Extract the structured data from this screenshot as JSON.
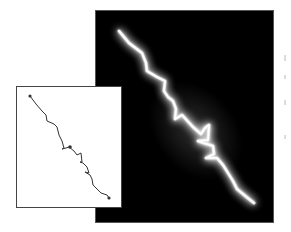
{
  "figure": {
    "main_panel": {
      "description": "Glowing lightning discharge on black background",
      "background_color": "#000000",
      "glow_color": "#ffffff",
      "bolt_path": [
        [
          23,
          20
        ],
        [
          33,
          32
        ],
        [
          46,
          42
        ],
        [
          50,
          52
        ],
        [
          51,
          60
        ],
        [
          61,
          66
        ],
        [
          69,
          70
        ],
        [
          68,
          80
        ],
        [
          72,
          86
        ],
        [
          77,
          90
        ],
        [
          80,
          98
        ],
        [
          79,
          108
        ],
        [
          86,
          104
        ],
        [
          97,
          116
        ],
        [
          105,
          123
        ],
        [
          109,
          117
        ],
        [
          113,
          114
        ],
        [
          112,
          129
        ],
        [
          102,
          130
        ],
        [
          117,
          135
        ],
        [
          118,
          143
        ],
        [
          110,
          147
        ],
        [
          121,
          147
        ],
        [
          127,
          154
        ],
        [
          132,
          162
        ],
        [
          137,
          170
        ],
        [
          141,
          178
        ],
        [
          153,
          188
        ],
        [
          158,
          192
        ]
      ]
    },
    "inset_panel": {
      "description": "Line trace of discharge path with markers",
      "background_color": "#ffffff",
      "line_color": "#333333",
      "trace_path": [
        [
          13,
          9
        ],
        [
          19,
          17
        ],
        [
          25,
          24
        ],
        [
          29,
          28
        ],
        [
          30,
          34
        ],
        [
          37,
          37
        ],
        [
          40,
          40
        ],
        [
          42,
          48
        ],
        [
          45,
          54
        ],
        [
          47,
          61
        ],
        [
          45,
          62
        ],
        [
          49,
          61
        ],
        [
          52,
          60
        ],
        [
          57,
          64
        ],
        [
          60,
          68
        ],
        [
          64,
          66
        ],
        [
          65,
          75
        ],
        [
          63,
          75
        ],
        [
          66,
          76
        ],
        [
          70,
          80
        ],
        [
          72,
          86
        ],
        [
          68,
          85
        ],
        [
          73,
          88
        ],
        [
          75,
          92
        ],
        [
          76,
          98
        ],
        [
          80,
          102
        ],
        [
          84,
          106
        ],
        [
          90,
          108
        ],
        [
          92,
          111
        ]
      ],
      "markers": [
        {
          "name": "start",
          "x": 13,
          "y": 9
        },
        {
          "name": "mid",
          "x": 53,
          "y": 60
        },
        {
          "name": "end",
          "x": 92,
          "y": 111
        }
      ]
    }
  }
}
